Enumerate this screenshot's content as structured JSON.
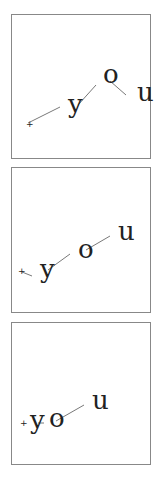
{
  "colors": {
    "border": "#888888",
    "ink": "#222222",
    "line": "#555555"
  },
  "panels": [
    {
      "id": "panel-1",
      "top": 14,
      "height": 145,
      "marker": {
        "label": "+",
        "x": 14,
        "y": 112
      },
      "letters": [
        {
          "label": "y",
          "x": 56,
          "y": 98
        },
        {
          "label": "o",
          "x": 91,
          "y": 68
        },
        {
          "label": "u",
          "x": 125,
          "y": 86
        }
      ],
      "links": [
        {
          "x1": 16,
          "y1": 108,
          "x2": 48,
          "y2": 92
        },
        {
          "x1": 66,
          "y1": 90,
          "x2": 84,
          "y2": 70
        },
        {
          "x1": 98,
          "y1": 66,
          "x2": 114,
          "y2": 80
        }
      ]
    },
    {
      "id": "panel-2",
      "top": 167,
      "height": 146,
      "marker": {
        "label": "+",
        "x": 6,
        "y": 106
      },
      "letters": [
        {
          "label": "y",
          "x": 28,
          "y": 110
        },
        {
          "label": "o",
          "x": 66,
          "y": 90
        },
        {
          "label": "u",
          "x": 106,
          "y": 72
        }
      ],
      "links": [
        {
          "x1": 10,
          "y1": 104,
          "x2": 20,
          "y2": 108
        },
        {
          "x1": 36,
          "y1": 102,
          "x2": 58,
          "y2": 86
        },
        {
          "x1": 74,
          "y1": 82,
          "x2": 98,
          "y2": 68
        }
      ]
    },
    {
      "id": "panel-3",
      "top": 322,
      "height": 143,
      "marker": {
        "label": "+",
        "x": 8,
        "y": 103
      },
      "letters": [
        {
          "label": "y",
          "x": 18,
          "y": 106
        },
        {
          "label": "o",
          "x": 37,
          "y": 104
        },
        {
          "label": "u",
          "x": 80,
          "y": 86
        }
      ],
      "links": [
        {
          "x1": 26,
          "y1": 100,
          "x2": 32,
          "y2": 100
        },
        {
          "x1": 44,
          "y1": 98,
          "x2": 72,
          "y2": 82
        }
      ]
    }
  ]
}
